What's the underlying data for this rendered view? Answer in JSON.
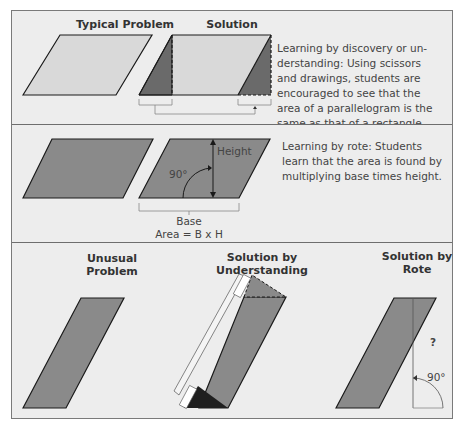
{
  "colors": {
    "background": "#ededed",
    "light_fill": "#d9d9d9",
    "mid_fill": "#8a8a8a",
    "dark_fill": "#5f5f5f",
    "black_fill": "#1f1f1f",
    "stroke": "#1a1a1a",
    "frame_border": "#7a7a7a"
  },
  "panel1": {
    "left_title": "Typical Problem",
    "right_title": "Solution",
    "description": "Learning by discovery or understanding: Using scissors and drawings, students are encouraged to see that the area of a parallelogram is the same as that of a rectangle.",
    "desc_lines": [
      "Learning by discovery or un-",
      "derstanding:  Using scissors",
      "and drawings, students are",
      "encouraged to see that the",
      "area of a parallelogram is the",
      "same as that of a rectangle."
    ]
  },
  "panel2": {
    "height_label": "Height",
    "angle_label": "90°",
    "base_label": "Base",
    "formula_label": "Area = B x H",
    "desc_lines": [
      "Learning by rote: Students",
      "learn that the area is found by",
      "multiplying base times height."
    ]
  },
  "panel3": {
    "col1_title_lines": [
      "Unusual",
      "Problem"
    ],
    "col2_title_lines": [
      "Solution by",
      "Understanding"
    ],
    "col3_title_lines": [
      "Solution by",
      "Rote"
    ],
    "question_mark": "?",
    "angle_label": "90°"
  }
}
